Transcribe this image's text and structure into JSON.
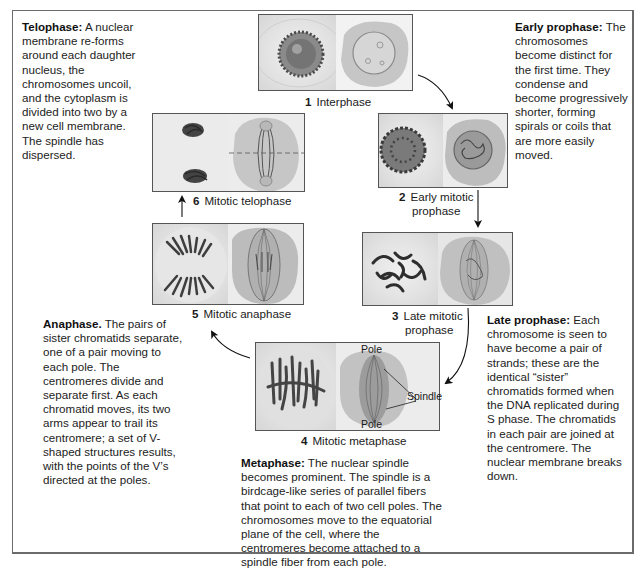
{
  "descriptions": {
    "telophase": {
      "title": "Telophase:",
      "text": "A nuclear membrane re-forms around each daughter nucleus, the chromosomes uncoil, and the cytoplasm is divided into two by a new cell membrane. The spindle has dispersed."
    },
    "early_prophase": {
      "title": "Early prophase:",
      "text": "The chromosomes become distinct for the first time. They condense and become progressively shorter, forming spirals or coils that are more easily moved."
    },
    "late_prophase": {
      "title": "Late prophase:",
      "text": "Each chromosome is seen to have become a pair of strands; these are the identical “sister” chromatids formed when the DNA replicated during S phase. The chromatids in each pair are joined at the centromere. The nuclear membrane breaks down."
    },
    "anaphase": {
      "title": "Anaphase.",
      "text": "The pairs of sister chromatids separate, one of a pair moving to each pole. The centromeres divide and separate first. As each chromatid moves, its two arms appear to trail its centromere; a set of V-shaped structures results, with the points of the V’s directed at the poles."
    },
    "metaphase": {
      "title": "Metaphase:",
      "text": "The nuclear spindle becomes prominent. The spindle is a birdcage-like series of parallel fibers that point to each of two cell poles. The chromosomes move to the equatorial plane of the cell, where the centromeres become attached to a spindle fiber from each pole."
    }
  },
  "stages": [
    {
      "num": "1",
      "label": "Interphase"
    },
    {
      "num": "2",
      "label": "Early mitotic prophase"
    },
    {
      "num": "3",
      "label": "Late mitotic prophase"
    },
    {
      "num": "4",
      "label": "Mitotic metaphase"
    },
    {
      "num": "5",
      "label": "Mitotic anaphase"
    },
    {
      "num": "6",
      "label": "Mitotic telophase"
    }
  ],
  "stage_lines": {
    "s2_line1": "Early mitotic",
    "s2_line2": "prophase",
    "s3_line1": "Late mitotic",
    "s3_line2": "prophase"
  },
  "annotations": {
    "pole_top": "Pole",
    "pole_bottom": "Pole",
    "spindle": "Spindle"
  },
  "colors": {
    "frame": "#6b6b6b",
    "panel_bg": "#e9e9e9",
    "cell_drawing": "#c4c4c4",
    "chromosome": "#3a3a3a",
    "text": "#1a1a1a"
  }
}
